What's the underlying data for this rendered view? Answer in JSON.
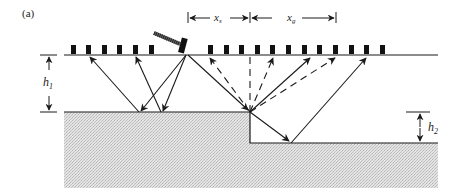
{
  "figure": {
    "panel_label": "(a)",
    "labels": {
      "h1": "h",
      "h1_sub": "1",
      "h2": "h",
      "h2_sub": "2",
      "xs": "x",
      "xs_sub": "s",
      "xg": "x",
      "xg_sub": "g"
    },
    "colors": {
      "line": "#1a1a1a",
      "geophone": "#111111",
      "rock_fill": "#d8d8d8",
      "background": "#ffffff"
    },
    "elements": {
      "surface": "ground surface line",
      "source": "hammer source",
      "receivers": "geophone array",
      "interface": "stepped refractor interface"
    }
  }
}
